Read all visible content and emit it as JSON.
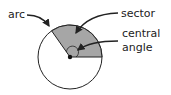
{
  "diagram": {
    "labels": {
      "arc": "arc",
      "sector": "sector",
      "central_line1": "central",
      "central_line2": "angle"
    },
    "colors": {
      "sector_fill": "#a6a6a6",
      "stroke": "#222222",
      "background": "#ffffff"
    },
    "circle": {
      "cx": 70,
      "cy": 57,
      "r": 32
    },
    "sector_angle_deg": 125
  }
}
